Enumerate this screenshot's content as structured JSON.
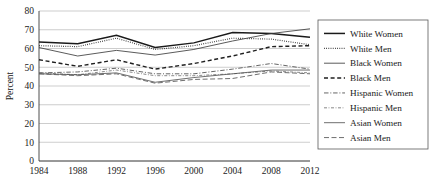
{
  "chart_data": {
    "type": "line",
    "title": "",
    "xlabel": "",
    "ylabel": "Percent",
    "x": [
      1984,
      1988,
      1992,
      1996,
      2000,
      2004,
      2008,
      2012
    ],
    "categories": [
      "1984",
      "1988",
      "1992",
      "1996",
      "2000",
      "2004",
      "2008",
      "2012"
    ],
    "ylim": [
      0,
      80
    ],
    "yticks": [
      0,
      10,
      20,
      30,
      40,
      50,
      60,
      70,
      80
    ],
    "ytick_labels": [
      "0",
      "10",
      "20",
      "30",
      "40",
      "50",
      "60",
      "70",
      "80"
    ],
    "grid": true,
    "legend_position": "right",
    "series": [
      {
        "name": "White Women",
        "values": [
          63.5,
          62.5,
          67.0,
          60.5,
          63.0,
          68.5,
          68.0,
          66.0
        ],
        "style": "solid",
        "width": 1.5,
        "color": "#1a1a1a",
        "dash": "none"
      },
      {
        "name": "White Men",
        "values": [
          61.5,
          61.0,
          65.5,
          59.5,
          61.5,
          65.5,
          65.0,
          62.0
        ],
        "style": "dotted",
        "width": 1.2,
        "color": "#2a2a2a",
        "dash": "0.8 1.4"
      },
      {
        "name": "Black Women",
        "values": [
          60.5,
          56.0,
          59.0,
          56.5,
          59.5,
          64.0,
          68.0,
          70.5
        ],
        "style": "solid-thin",
        "width": 0.85,
        "color": "#3d3d3d",
        "dash": "none"
      },
      {
        "name": "Black Men",
        "values": [
          54.0,
          50.5,
          54.0,
          49.0,
          52.0,
          56.0,
          61.0,
          61.5
        ],
        "style": "dashed",
        "width": 1.4,
        "color": "#1f1f1f",
        "dash": "4 2.6"
      },
      {
        "name": "Hispanic Women",
        "values": [
          47.0,
          47.5,
          49.5,
          46.5,
          46.5,
          49.0,
          52.0,
          49.0
        ],
        "style": "dash-dot",
        "width": 0.9,
        "color": "#555555",
        "dash": "4.5 1.8 1 1.8"
      },
      {
        "name": "Hispanic Men",
        "values": [
          47.0,
          46.0,
          48.5,
          45.5,
          45.5,
          46.5,
          48.0,
          47.0
        ],
        "style": "dash-dot-fine",
        "width": 0.8,
        "color": "#6a6a6a",
        "dash": "3 1.6 0.8 1.6"
      },
      {
        "name": "Asian Women",
        "values": [
          46.5,
          46.0,
          47.0,
          42.0,
          44.5,
          46.5,
          48.5,
          48.5
        ],
        "style": "solid-thin",
        "width": 0.8,
        "color": "#4a4a4a",
        "dash": "none"
      },
      {
        "name": "Asian Men",
        "values": [
          46.5,
          45.5,
          46.5,
          41.5,
          43.5,
          44.0,
          47.5,
          46.5
        ],
        "style": "long-dash",
        "width": 0.9,
        "color": "#5f5f5f",
        "dash": "5 2.5"
      }
    ]
  },
  "legend": {
    "items": [
      {
        "label": "White Women"
      },
      {
        "label": "White Men"
      },
      {
        "label": "Black Women"
      },
      {
        "label": "Black Men"
      },
      {
        "label": "Hispanic Women"
      },
      {
        "label": "Hispanic Men"
      },
      {
        "label": "Asian Women"
      },
      {
        "label": "Asian Men"
      }
    ]
  }
}
